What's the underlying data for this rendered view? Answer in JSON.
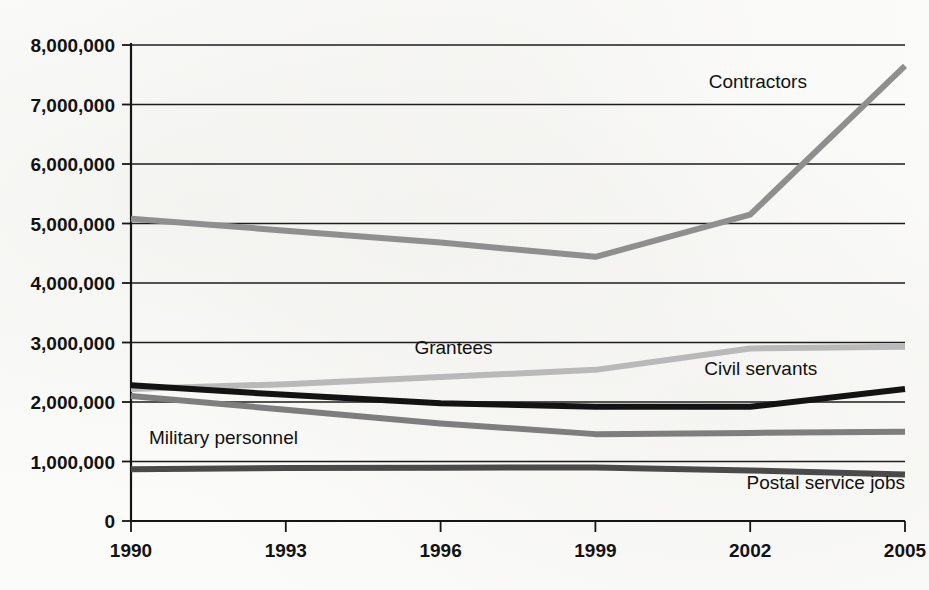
{
  "chart_data": {
    "type": "line",
    "title": "",
    "subtitle": "",
    "xlabel": "",
    "ylabel": "",
    "x": [
      1990,
      1993,
      1996,
      1999,
      2002,
      2005
    ],
    "xtick_labels": [
      "1990",
      "1993",
      "1996",
      "1999",
      "2002",
      "2005"
    ],
    "xlim": [
      1990,
      2005
    ],
    "ylim": [
      0,
      8000000
    ],
    "ytick_values": [
      0,
      1000000,
      2000000,
      3000000,
      4000000,
      5000000,
      6000000,
      7000000,
      8000000
    ],
    "ytick_labels": [
      "0",
      "1,000,000",
      "2,000,000",
      "3,000,000",
      "4,000,000",
      "5,000,000",
      "6,000,000",
      "7,000,000",
      "8,000,000"
    ],
    "grid": true,
    "grid_axis": "y",
    "legend_position": "inline-annotations",
    "series": [
      {
        "name": "Contractors",
        "color": "#8f8f8f",
        "width": 6,
        "values": [
          5080000,
          4880000,
          4680000,
          4440000,
          5150000,
          7650000
        ],
        "label": "Contractors",
        "label_x": 2003.1,
        "label_y": 7280000,
        "label_anchor": "end"
      },
      {
        "name": "Grantees",
        "color": "#b9b9b9",
        "width": 6,
        "values": [
          2220000,
          2300000,
          2420000,
          2540000,
          2900000,
          2930000
        ],
        "label": "Grantees",
        "label_x": 1996.25,
        "label_y": 2800000,
        "label_anchor": "middle"
      },
      {
        "name": "Civil servants",
        "color": "#131313",
        "width": 6,
        "values": [
          2280000,
          2120000,
          1980000,
          1920000,
          1920000,
          2220000
        ],
        "label": "Civil servants",
        "label_x": 2003.3,
        "label_y": 2460000,
        "label_anchor": "end"
      },
      {
        "name": "Military personnel",
        "color": "#7e7e7e",
        "width": 6,
        "values": [
          2100000,
          1870000,
          1640000,
          1460000,
          1480000,
          1500000
        ],
        "label": "Military personnel",
        "label_x": 1990.35,
        "label_y": 1290000,
        "label_anchor": "start"
      },
      {
        "name": "Postal service jobs",
        "color": "#4a4a4a",
        "width": 6,
        "values": [
          870000,
          890000,
          895000,
          900000,
          850000,
          780000
        ],
        "label": "Postal service jobs",
        "label_x": 2005.0,
        "label_y": 530000,
        "label_anchor": "end"
      }
    ]
  },
  "colors": {
    "background": "#fbfbf9",
    "axis": "#151515",
    "grid": "#1d1d1d",
    "text": "#111111"
  }
}
